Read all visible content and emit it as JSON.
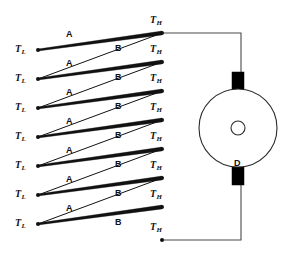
{
  "diagram": {
    "colors": {
      "line": "#111111",
      "wire": "#4a4a4a",
      "block": "#000000",
      "background": "#ffffff",
      "text": "#111111"
    },
    "cold_junction_label": "T",
    "cold_junction_sub": "L",
    "hot_junction_label": "T",
    "hot_junction_sub": "H",
    "leg_a_label": "A",
    "leg_b_label": "B",
    "disk_label": "D",
    "cold_nodes": [
      {
        "id": "TL1",
        "x": 38,
        "y": 50,
        "label": "T",
        "sub": "L"
      },
      {
        "id": "TL2",
        "x": 38,
        "y": 79,
        "label": "T",
        "sub": "L"
      },
      {
        "id": "TL3",
        "x": 38,
        "y": 108,
        "label": "T",
        "sub": "L"
      },
      {
        "id": "TL4",
        "x": 38,
        "y": 137,
        "label": "T",
        "sub": "L"
      },
      {
        "id": "TL5",
        "x": 38,
        "y": 166,
        "label": "T",
        "sub": "L"
      },
      {
        "id": "TL6",
        "x": 38,
        "y": 195,
        "label": "T",
        "sub": "L"
      },
      {
        "id": "TL7",
        "x": 38,
        "y": 224,
        "label": "T",
        "sub": "L"
      }
    ],
    "hot_nodes": [
      {
        "id": "TH1",
        "x": 162,
        "y": 33,
        "label": "T",
        "sub": "H"
      },
      {
        "id": "TH2",
        "x": 162,
        "y": 62,
        "label": "T",
        "sub": "H"
      },
      {
        "id": "TH3",
        "x": 162,
        "y": 91,
        "label": "T",
        "sub": "H"
      },
      {
        "id": "TH4",
        "x": 162,
        "y": 120,
        "label": "T",
        "sub": "H"
      },
      {
        "id": "TH5",
        "x": 162,
        "y": 149,
        "label": "T",
        "sub": "H"
      },
      {
        "id": "TH6",
        "x": 162,
        "y": 178,
        "label": "T",
        "sub": "H"
      },
      {
        "id": "TH7",
        "x": 162,
        "y": 207,
        "label": "T",
        "sub": "H"
      },
      {
        "id": "TH8",
        "x": 162,
        "y": 240,
        "label": "T",
        "sub": "H"
      }
    ],
    "leg_a_segments": [
      {
        "label": "A",
        "x1": 38,
        "y1": 50,
        "x2": 162,
        "y2": 33,
        "lx": 66,
        "ly": 30
      },
      {
        "label": "A",
        "x1": 38,
        "y1": 79,
        "x2": 162,
        "y2": 62,
        "lx": 66,
        "ly": 59
      },
      {
        "label": "A",
        "x1": 38,
        "y1": 108,
        "x2": 162,
        "y2": 91,
        "lx": 66,
        "ly": 88
      },
      {
        "label": "A",
        "x1": 38,
        "y1": 137,
        "x2": 162,
        "y2": 120,
        "lx": 66,
        "ly": 117
      },
      {
        "label": "A",
        "x1": 38,
        "y1": 166,
        "x2": 162,
        "y2": 149,
        "lx": 66,
        "ly": 146
      },
      {
        "label": "A",
        "x1": 38,
        "y1": 195,
        "x2": 162,
        "y2": 178,
        "lx": 66,
        "ly": 175
      },
      {
        "label": "A",
        "x1": 38,
        "y1": 224,
        "x2": 162,
        "y2": 207,
        "lx": 66,
        "ly": 204
      }
    ],
    "leg_b_segments": [
      {
        "label": "B",
        "x1": 162,
        "y1": 33,
        "x2": 38,
        "y2": 79,
        "lx": 115,
        "ly": 44
      },
      {
        "label": "B",
        "x1": 162,
        "y1": 62,
        "x2": 38,
        "y2": 108,
        "lx": 115,
        "ly": 73
      },
      {
        "label": "B",
        "x1": 162,
        "y1": 91,
        "x2": 38,
        "y2": 137,
        "lx": 115,
        "ly": 102
      },
      {
        "label": "B",
        "x1": 162,
        "y1": 120,
        "x2": 38,
        "y2": 166,
        "lx": 115,
        "ly": 131
      },
      {
        "label": "B",
        "x1": 162,
        "y1": 149,
        "x2": 38,
        "y2": 195,
        "lx": 115,
        "ly": 160
      },
      {
        "label": "B",
        "x1": 162,
        "y1": 178,
        "x2": 38,
        "y2": 224,
        "lx": 115,
        "ly": 189
      },
      {
        "label": "B",
        "x1": 162,
        "y1": 207,
        "x2": 38,
        "y2": 224,
        "lx": 115,
        "ly": 218
      }
    ],
    "disk": {
      "cx": 238,
      "cy": 128,
      "r": 39,
      "hub_r": 7,
      "label": "D",
      "label_x": 234,
      "label_y": 159,
      "top_block": {
        "x": 232,
        "y": 72,
        "w": 12,
        "h": 18
      },
      "bottom_block": {
        "x": 232,
        "y": 167,
        "w": 12,
        "h": 18
      }
    },
    "wires": [
      {
        "id": "top-wire",
        "points": "162,33 241,33 241,72"
      },
      {
        "id": "bottom-wire",
        "points": "162,240 241,240 241,185"
      }
    ]
  }
}
